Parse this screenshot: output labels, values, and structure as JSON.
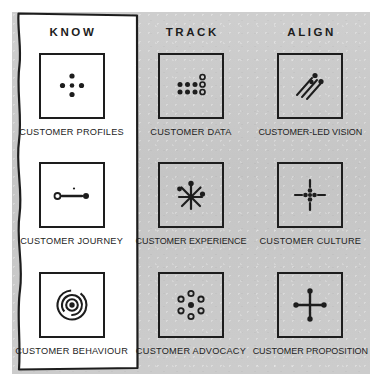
{
  "page": {
    "panel_color": "#c9c9c9",
    "ink_color": "#1d1d1d",
    "highlight_color": "#ffffff"
  },
  "columns": [
    {
      "id": "know",
      "heading": "KNOW"
    },
    {
      "id": "track",
      "heading": "TRACK"
    },
    {
      "id": "align",
      "heading": "ALIGN"
    }
  ],
  "cells": [
    {
      "id": "customer-profiles",
      "column": "know",
      "row": 1,
      "label": "CUSTOMER PROFILES",
      "icon": "five-dots-diamond-icon"
    },
    {
      "id": "customer-data",
      "column": "track",
      "row": 1,
      "label": "CUSTOMER DATA",
      "icon": "dot-grid-filled-hollow-icon"
    },
    {
      "id": "customer-led-vision",
      "column": "align",
      "row": 1,
      "label": "CUSTOMER-LED VISION",
      "icon": "diagonal-motion-lines-icon"
    },
    {
      "id": "customer-journey",
      "column": "know",
      "row": 2,
      "label": "CUSTOMER JOURNEY",
      "icon": "path-line-two-nodes-icon"
    },
    {
      "id": "customer-experience",
      "column": "track",
      "row": 2,
      "label": "CUSTOMER EXPERIENCE",
      "icon": "starburst-asterisk-icon"
    },
    {
      "id": "customer-culture",
      "column": "align",
      "row": 2,
      "label": "CUSTOMER CULTURE",
      "icon": "dot-cluster-four-dashes-icon"
    },
    {
      "id": "customer-behaviour",
      "column": "know",
      "row": 3,
      "label": "CUSTOMER BEHAVIOUR",
      "icon": "concentric-target-icon"
    },
    {
      "id": "customer-advocacy",
      "column": "track",
      "row": 3,
      "label": "CUSTOMER ADVOCACY",
      "icon": "hub-with-six-rings-icon"
    },
    {
      "id": "customer-proposition",
      "column": "align",
      "row": 3,
      "label": "CUSTOMER PROPOSITION",
      "icon": "cross-with-four-dots-icon"
    }
  ]
}
